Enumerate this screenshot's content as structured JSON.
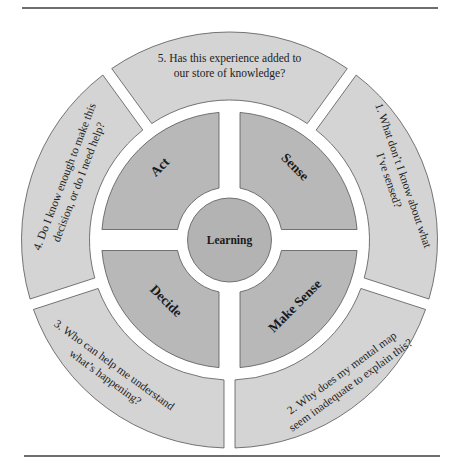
{
  "figure": {
    "hub": {
      "label": "Learning"
    },
    "quadrants": [
      {
        "id": "act",
        "label": "Act"
      },
      {
        "id": "sense",
        "label": "Sense"
      },
      {
        "id": "make-sense",
        "label": "Make Sense"
      },
      {
        "id": "decide",
        "label": "Decide"
      }
    ],
    "outer_segments": [
      {
        "id": "q1",
        "lines": [
          "1. What don’t I know about what",
          "I’ve sensed?"
        ]
      },
      {
        "id": "q2",
        "lines": [
          "2. Why does my mental map",
          "seem inadequate to explain this?"
        ]
      },
      {
        "id": "q3",
        "lines": [
          "3. Who can help me understand",
          "what’s happening?"
        ]
      },
      {
        "id": "q4",
        "lines": [
          "4. Do I know enough to make this",
          "decision, or do I need help?"
        ]
      },
      {
        "id": "q5",
        "lines": [
          "5. Has this experience added to",
          "our store of knowledge?"
        ]
      }
    ],
    "colors": {
      "outer_fill": "#d4d4d4",
      "quadrant_fill": "#b8b8b8",
      "hub_fill": "#b3b3b3",
      "stroke": "#555555"
    }
  }
}
